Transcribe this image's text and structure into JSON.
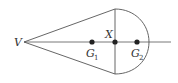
{
  "diagram": {
    "labels": {
      "vertex": "V",
      "center": "X",
      "g1_main": "G",
      "g1_sub": "1",
      "g2_main": "G",
      "g2_sub": "2"
    },
    "colors": {
      "stroke": "#333333",
      "point": "#222222",
      "background": "#ffffff"
    }
  }
}
